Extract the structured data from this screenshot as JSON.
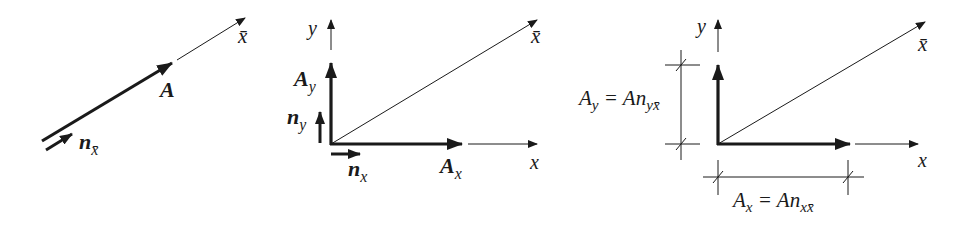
{
  "panels": [
    {
      "name": "vector-along-xbar",
      "labels": {
        "axis_xbar": "x̄",
        "vector": "A",
        "unit_vector": "n",
        "unit_vector_sub": "x̄"
      }
    },
    {
      "name": "components-with-unit-vectors",
      "labels": {
        "axis_y": "y",
        "axis_x": "x",
        "axis_xbar": "x̄",
        "comp_y": "A",
        "comp_y_sub": "y",
        "comp_x": "A",
        "comp_x_sub": "x",
        "unit_y": "n",
        "unit_y_sub": "y",
        "unit_x": "n",
        "unit_x_sub": "x"
      }
    },
    {
      "name": "component-magnitudes",
      "labels": {
        "axis_y": "y",
        "axis_x": "x",
        "axis_xbar": "x̄",
        "dim_y_lhs": "A",
        "dim_y_lhs_sub": "y",
        "dim_y_eq": " = An",
        "dim_y_rhs_sub": "yx̄",
        "dim_x_lhs": "A",
        "dim_x_lhs_sub": "x",
        "dim_x_eq": " = An",
        "dim_x_rhs_sub": "xx̄"
      }
    }
  ],
  "colors": {
    "ink": "#1a1a1a",
    "background": "#ffffff"
  }
}
